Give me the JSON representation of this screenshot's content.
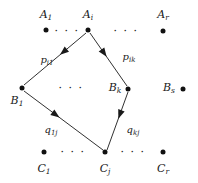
{
  "diagram": {
    "background_color": "#ffffff",
    "ink_color": "#1a1a1a",
    "rows": [
      {
        "id": "row-a",
        "nodes": [
          {
            "name": "A",
            "sub": "1",
            "x": 46,
            "y": 30,
            "label_x": 46,
            "label_y": 14
          },
          {
            "name": "A",
            "sub": "i",
            "x": 88,
            "y": 30,
            "label_x": 88,
            "label_y": 14
          },
          {
            "name": "A",
            "sub": "r",
            "x": 163,
            "y": 31,
            "label_x": 163,
            "label_y": 14
          }
        ],
        "ellipses": [
          {
            "text": "· · ·",
            "x": 67,
            "y": 31
          },
          {
            "text": "· · ·",
            "x": 126,
            "y": 31
          }
        ]
      },
      {
        "id": "row-b",
        "nodes": [
          {
            "name": "B",
            "sub": "1",
            "x": 22,
            "y": 88,
            "label_x": 17,
            "label_y": 100
          },
          {
            "name": "B",
            "sub": "k",
            "x": 128,
            "y": 89,
            "label_x": 115,
            "label_y": 87
          },
          {
            "name": "B",
            "sub": "s",
            "x": 183,
            "y": 89,
            "label_x": 169,
            "label_y": 87
          }
        ],
        "ellipses": [
          {
            "text": "· · ·",
            "x": 71,
            "y": 88
          }
        ]
      },
      {
        "id": "row-c",
        "nodes": [
          {
            "name": "C",
            "sub": "1",
            "x": 44,
            "y": 152,
            "label_x": 44,
            "label_y": 168
          },
          {
            "name": "C",
            "sub": "j",
            "x": 105,
            "y": 152,
            "label_x": 105,
            "label_y": 168
          },
          {
            "name": "C",
            "sub": "r",
            "x": 163,
            "y": 152,
            "label_x": 163,
            "label_y": 168
          }
        ],
        "ellipses": [
          {
            "text": "· · ·",
            "x": 73,
            "y": 152
          },
          {
            "text": "· · ·",
            "x": 133,
            "y": 152
          }
        ]
      }
    ],
    "edges": [
      {
        "id": "edge-ai-b1",
        "from": "A_i",
        "to": "B_1",
        "label": "p",
        "label_sub": "i1",
        "label_x": 47,
        "label_y": 60,
        "x1": 86,
        "y1": 33,
        "x2": 24,
        "y2": 85,
        "arrow_at": 0.42
      },
      {
        "id": "edge-ai-bk",
        "from": "A_i",
        "to": "B_k",
        "label": "p",
        "label_sub": "ik",
        "label_x": 129,
        "label_y": 57,
        "x1": 90,
        "y1": 33,
        "x2": 127,
        "y2": 86,
        "arrow_at": 0.45
      },
      {
        "id": "edge-b1-cj",
        "from": "B_1",
        "to": "C_j",
        "label": "q",
        "label_sub": "1j",
        "label_x": 51,
        "label_y": 130,
        "x1": 24,
        "y1": 91,
        "x2": 103,
        "y2": 150,
        "arrow_at": 0.45
      },
      {
        "id": "edge-bk-cj",
        "from": "B_k",
        "to": "C_j",
        "label": "q",
        "label_sub": "kj",
        "label_x": 133,
        "label_y": 130,
        "x1": 128,
        "y1": 92,
        "x2": 107,
        "y2": 150,
        "arrow_at": 0.46
      }
    ]
  }
}
